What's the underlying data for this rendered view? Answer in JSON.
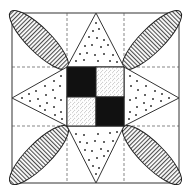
{
  "diagram": {
    "colors": {
      "background": "#ffffff",
      "stroke": "#333333",
      "dark_square": "#111111",
      "dashed_guides": "#555555"
    },
    "frame": {
      "x": 12,
      "y": 13,
      "width": 167,
      "height": 170
    },
    "grid_guides": {
      "x": [
        67,
        124
      ],
      "y": [
        67,
        126
      ],
      "style": "dashed"
    },
    "center_squares": [
      {
        "position": "top-left",
        "fill": "solid-black"
      },
      {
        "position": "top-right",
        "fill": "fine-stipple"
      },
      {
        "position": "bottom-left",
        "fill": "fine-stipple"
      },
      {
        "position": "bottom-right",
        "fill": "solid-black"
      }
    ],
    "triangles": [
      {
        "position": "top",
        "fill": "dots"
      },
      {
        "position": "right",
        "fill": "dots"
      },
      {
        "position": "bottom",
        "fill": "dots"
      },
      {
        "position": "left",
        "fill": "dots"
      }
    ],
    "petals": [
      {
        "position": "top-left",
        "fill": "vertical-stripes"
      },
      {
        "position": "top-right",
        "fill": "vertical-stripes"
      },
      {
        "position": "bottom-left",
        "fill": "vertical-stripes"
      },
      {
        "position": "bottom-right",
        "fill": "vertical-stripes"
      }
    ]
  }
}
